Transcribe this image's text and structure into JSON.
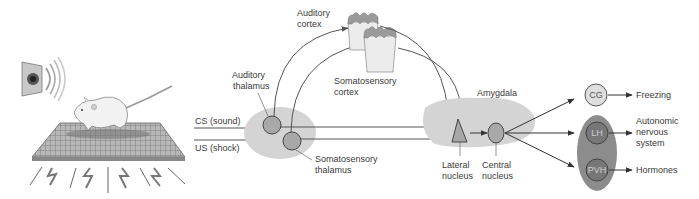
{
  "diagram": {
    "inputs": {
      "cs_label": "CS (sound)",
      "us_label": "US (shock)"
    },
    "thalamus": {
      "auditory_label_line1": "Auditory",
      "auditory_label_line2": "thalamus",
      "somatosensory_label_line1": "Somatosensory",
      "somatosensory_label_line2": "thalamus"
    },
    "cortex": {
      "auditory_label_line1": "Auditory",
      "auditory_label_line2": "cortex",
      "somatosensory_label_line1": "Somatosensory",
      "somatosensory_label_line2": "cortex"
    },
    "amygdala": {
      "label": "Amygdala",
      "lateral_line1": "Lateral",
      "lateral_line2": "nucleus",
      "central_line1": "Central",
      "central_line2": "nucleus"
    },
    "outputs": {
      "cg": "CG",
      "lh": "LH",
      "pvh": "PVH",
      "freezing": "Freezing",
      "ans_line1": "Autonomic",
      "ans_line2": "nervous",
      "ans_line3": "system",
      "hormones": "Hormones"
    },
    "colors": {
      "region_fill": "#d4d4d4",
      "nucleus_fill": "#a8a8a8",
      "dark_oval": "#8c8c8c",
      "dark_node": "#777777",
      "light_node": "#dedede",
      "arrow": "#555555",
      "cortex_fill": "#ececec",
      "cortex_top": "#9a9a9a"
    }
  }
}
